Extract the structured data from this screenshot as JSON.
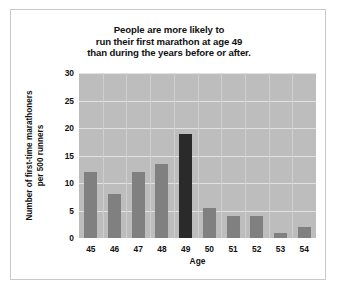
{
  "figure": {
    "title_lines": [
      "People are more likely to",
      "run their first marathon at age 49",
      "than during the years before or after."
    ],
    "ylabel_lines": [
      "Number of first-time marathoners",
      "per 500 runners"
    ]
  },
  "colors": {
    "bar": "#808080",
    "bar_highlight": "#2a2a2a",
    "plot_background": "#bdbdbd",
    "gridline": "#e2e2e2",
    "figure_background": "#ffffff",
    "text": "#111111"
  },
  "chart_data": {
    "type": "bar",
    "title": "People are more likely to run their first marathon at age 49 than during the years before or after.",
    "xlabel": "Age",
    "ylabel": "Number of first-time marathoners per 500 runners",
    "categories": [
      "45",
      "46",
      "47",
      "48",
      "49",
      "50",
      "51",
      "52",
      "53",
      "54"
    ],
    "values": [
      12,
      8,
      12,
      13.5,
      19,
      5.5,
      4,
      4,
      1,
      2
    ],
    "highlight_category": "49",
    "ylim": [
      0,
      30
    ],
    "ytick_labels": [
      "0",
      "5",
      "10",
      "15",
      "20",
      "25",
      "30"
    ],
    "ytick_values": [
      0,
      5,
      10,
      15,
      20,
      25,
      30
    ],
    "grid": "horizontal-and-vertical",
    "legend": "none"
  }
}
